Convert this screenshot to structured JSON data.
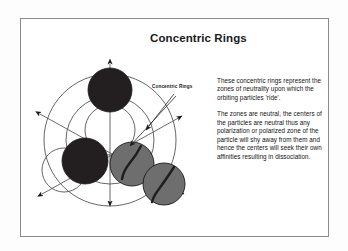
{
  "slide": {
    "title": "Concentric Rings",
    "callout_label": "Concentric Rings",
    "paragraphs": [
      "These concentric rings represent the zones of neutrality upon which the orbiting particles 'ride'.",
      "The zones are neutral, the centers of the particles are neutral thus any polarization or polarized zone of the particle will shy away from them and hence the centers will seek their own affinities resulting in dissociation."
    ]
  },
  "colors": {
    "background": "#ffffff",
    "page_background": "#fdfdfd",
    "frame_border": "#8a8a90",
    "text": "#111111",
    "title": "#1a1a1a",
    "ring_stroke": "#4a4a4a",
    "axis_stroke": "#5a5a5a",
    "sphere_dark": "#231f20",
    "sphere_gray": "#6e6e6e",
    "sphere_outline": "#1a1a1a",
    "arrow_fill": "#1a1a1a"
  },
  "diagram": {
    "name": "concentric-rings-diagram",
    "rings": [
      {
        "name": "outer-ring",
        "cx": 86,
        "cy": 94,
        "r": 66
      },
      {
        "name": "middle-ring",
        "cx": 86,
        "cy": 94,
        "r": 44
      },
      {
        "name": "inner-ring-upper",
        "cx": 86,
        "cy": 84,
        "r": 25
      },
      {
        "name": "inner-ring-lower-left",
        "cx": 40,
        "cy": 124,
        "r": 22
      }
    ],
    "spheres": [
      {
        "name": "sphere-top-dark",
        "cx": 86,
        "cy": 44,
        "r": 22,
        "shade": "dark"
      },
      {
        "name": "sphere-left-dark",
        "cx": 61,
        "cy": 115,
        "r": 23,
        "shade": "dark"
      },
      {
        "name": "sphere-center-gray",
        "cx": 108,
        "cy": 118,
        "r": 22,
        "shade": "gray"
      },
      {
        "name": "sphere-right-gray",
        "cx": 140,
        "cy": 138,
        "r": 21,
        "shade": "gray"
      }
    ],
    "axes": [
      {
        "name": "axis-vertical",
        "x1": 86,
        "y1": 18,
        "x2": 86,
        "y2": 160,
        "arrow": "both"
      },
      {
        "name": "axis-diagonal-nw-se",
        "x1": 16,
        "y1": 68,
        "x2": 160,
        "y2": 148,
        "arrow": "both"
      },
      {
        "name": "axis-diagonal-sw-ne",
        "x1": 18,
        "y1": 148,
        "x2": 158,
        "y2": 70,
        "arrow": "both"
      }
    ],
    "leaders": [
      {
        "name": "leader-line-upper",
        "x1": 148,
        "y1": 50,
        "x2": 120,
        "y2": 86
      },
      {
        "name": "leader-line-lower",
        "x1": 150,
        "y1": 52,
        "x2": 104,
        "y2": 102
      }
    ]
  }
}
